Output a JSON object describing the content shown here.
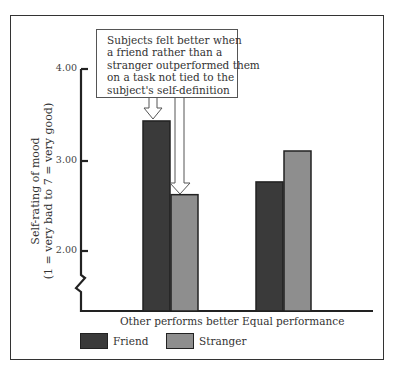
{
  "chart_data": {
    "type": "bar",
    "title": "",
    "annotation": "Subjects felt better when a friend rather than a stranger outperformed them on a task not tied to the subject's self-definition",
    "annotation_lines": [
      "Subjects felt better when",
      "a friend rather than a",
      "stranger outperformed them",
      "on a task not tied to the",
      "subject's self-definition"
    ],
    "xlabel": "",
    "ylabel": "Self-rating of mood",
    "ylabel_sub": "(1 = very bad to 7 = very good)",
    "yticks": [
      "2.00",
      "3.00",
      "4.00"
    ],
    "ylim": [
      1.5,
      4.0
    ],
    "axis_break": true,
    "categories": [
      "Other performs better",
      "Equal performance"
    ],
    "series": [
      {
        "name": "Friend",
        "color": "#3a3a3a",
        "values": [
          3.44,
          2.77
        ]
      },
      {
        "name": "Stranger",
        "color": "#8e8e8e",
        "values": [
          2.63,
          3.11
        ]
      }
    ],
    "legend_position": "bottom-left",
    "grid": false
  }
}
